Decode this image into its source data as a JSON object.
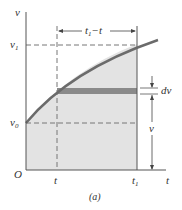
{
  "figure": {
    "caption": "(a)",
    "colors": {
      "curve": "#6b6b6b",
      "fill": "#e3e3e3",
      "band": "#8a8a8a",
      "axis": "#555555",
      "dashed": "#777777",
      "text": "#333333"
    },
    "axes": {
      "y_label": "v",
      "x_label": "t",
      "origin_label": "O"
    },
    "y_ticks": [
      {
        "main": "v",
        "sub": "1"
      },
      {
        "main": "v",
        "sub": "0"
      }
    ],
    "x_ticks": [
      {
        "main": "t",
        "sub": ""
      },
      {
        "main": "t",
        "sub": "1"
      }
    ],
    "annotations": {
      "interval": "t₁−t",
      "interval_main": "t",
      "interval_sub": "1",
      "interval_rest": "−t",
      "differential": "dv",
      "height": "v"
    }
  }
}
